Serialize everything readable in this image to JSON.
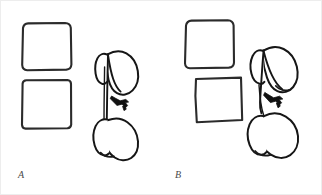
{
  "figure": {
    "width": 322,
    "height": 195,
    "background_color": "#ffffff",
    "frame_color": "#ededed",
    "ink_color": "#1a1a1a",
    "marker_color": "#111111",
    "style": "hand-drawn line art, two-panel comparison figure"
  },
  "panels": [
    {
      "id": "a",
      "label": "A",
      "label_style": "italic serif",
      "squares": [
        {
          "name": "upper-square",
          "x": 19,
          "y": 22,
          "width": 52,
          "height": 48,
          "corner": "rounded"
        },
        {
          "name": "lower-square",
          "x": 19,
          "y": 79,
          "width": 51,
          "height": 49,
          "corner": "slightly-rounded"
        }
      ],
      "plant": {
        "name": "leaf-stem-sketch",
        "stem_orientation": "vertical",
        "upper_leaf": "broad rounded lobe, upper right of stem",
        "lower_leaf": "broad rounded lobe, lower right of stem",
        "marker": "dark filled arrow pointing left at mid-stem"
      }
    },
    {
      "id": "b",
      "label": "B",
      "label_style": "italic serif",
      "squares": [
        {
          "name": "upper-square",
          "x": 21,
          "y": 19,
          "width": 50,
          "height": 48,
          "corner": "rounded"
        },
        {
          "name": "lower-square",
          "x": 33,
          "y": 76,
          "width": 47,
          "height": 45,
          "corner": "sharp"
        }
      ],
      "plant": {
        "name": "leaf-stem-sketch",
        "stem_orientation": "slanted",
        "upper_leaf": "broad rounded lobe, tilted, upper right of stem",
        "lower_leaf": "broad rounded lobe, tilted, lower right of stem",
        "marker": "dark filled arrow pointing left at mid-stem"
      }
    }
  ]
}
